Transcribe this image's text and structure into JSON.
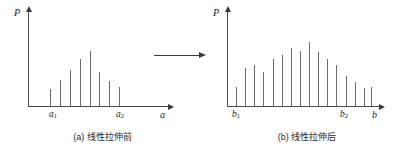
{
  "figure": {
    "transform_arrow_label": "maps-to-arrow"
  },
  "panel_a": {
    "y_axis_label": "P",
    "x_axis_label": "a",
    "tick_1": "a",
    "tick_1_sub": "1",
    "tick_2": "a",
    "tick_2_sub": "2",
    "caption": "(a) 线性拉伸前"
  },
  "panel_b": {
    "y_axis_label": "P",
    "x_axis_label": "b",
    "tick_1": "b",
    "tick_1_sub": "1",
    "tick_2": "b",
    "tick_2_sub": "2",
    "caption": "(b) 线性拉伸后"
  },
  "chart_data": [
    {
      "type": "bar",
      "id": "histogram-before",
      "title": "(a) 线性拉伸前",
      "xlabel": "a",
      "ylabel": "P",
      "grid": false,
      "legend": null,
      "xlim": [
        0,
        100
      ],
      "ylim": [
        0,
        100
      ],
      "tick_positions": [
        16,
        63
      ],
      "tick_labels": [
        "a₁",
        "a₂"
      ],
      "x": [
        16,
        23,
        30,
        37,
        44,
        51,
        58,
        65
      ],
      "values": [
        18,
        28,
        38,
        50,
        58,
        36,
        27,
        20
      ],
      "bar_color": "#6b6b6b"
    },
    {
      "type": "bar",
      "id": "histogram-after",
      "title": "(b) 线性拉伸后",
      "xlabel": "b",
      "ylabel": "P",
      "grid": false,
      "legend": null,
      "xlim": [
        0,
        100
      ],
      "ylim": [
        0,
        100
      ],
      "tick_positions": [
        6,
        79
      ],
      "tick_labels": [
        "b₁",
        "b₂"
      ],
      "x": [
        6,
        12,
        18,
        24,
        30,
        36,
        42,
        48,
        54,
        60,
        66,
        72,
        78,
        84,
        90,
        95
      ],
      "values": [
        20,
        40,
        44,
        36,
        50,
        54,
        62,
        58,
        68,
        57,
        50,
        44,
        32,
        26,
        19,
        20
      ],
      "bar_color": "#6b6b6b"
    }
  ]
}
